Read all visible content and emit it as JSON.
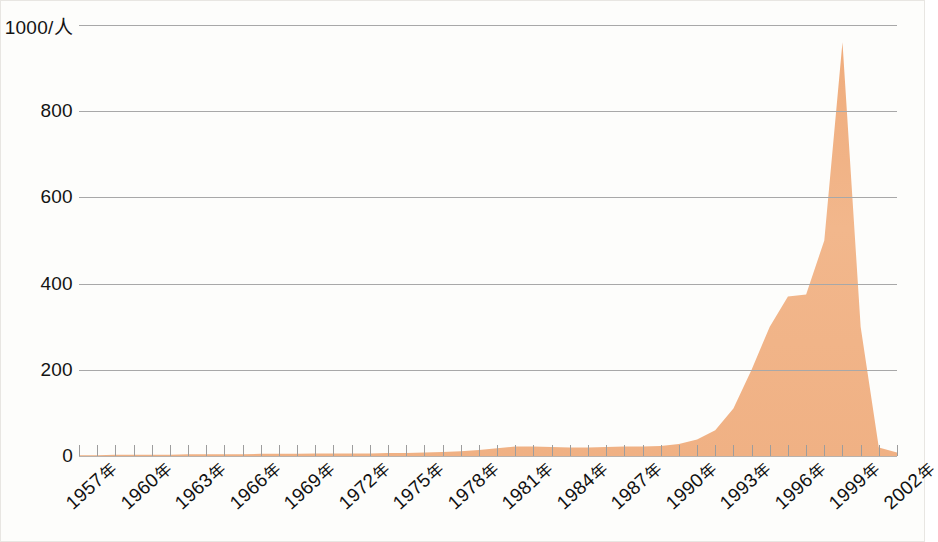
{
  "chart_data": {
    "type": "area",
    "title": "",
    "subtitle": "",
    "xlabel": "",
    "ylabel": "1000/人",
    "unit_label": "1000/人",
    "grid": true,
    "legend": "none",
    "xlim": [
      1957,
      2002
    ],
    "ylim": [
      0,
      1000
    ],
    "ytick_labels": [
      "0",
      "200",
      "400",
      "600",
      "800",
      "1000/人"
    ],
    "ytick_values": [
      0,
      200,
      400,
      600,
      800,
      1000
    ],
    "xtick_labels": [
      "1957年",
      "1960年",
      "1963年",
      "1966年",
      "1969年",
      "1972年",
      "1975年",
      "1978年",
      "1981年",
      "1984年",
      "1987年",
      "1990年",
      "1993年",
      "1996年",
      "1999年",
      "2002年"
    ],
    "xtick_values": [
      1957,
      1960,
      1963,
      1966,
      1969,
      1972,
      1975,
      1978,
      1981,
      1984,
      1987,
      1990,
      1993,
      1996,
      1999,
      2002
    ],
    "xtick_interval": 3,
    "series_color": "#f0b184",
    "series": [
      {
        "name": "人数",
        "x": [
          1957,
          1958,
          1959,
          1960,
          1961,
          1962,
          1963,
          1964,
          1965,
          1966,
          1967,
          1968,
          1969,
          1970,
          1971,
          1972,
          1973,
          1974,
          1975,
          1976,
          1977,
          1978,
          1979,
          1980,
          1981,
          1982,
          1983,
          1984,
          1985,
          1986,
          1987,
          1988,
          1989,
          1990,
          1991,
          1992,
          1993,
          1994,
          1995,
          1996,
          1997,
          1998,
          1999,
          2000,
          2001,
          2002
        ],
        "values": [
          2,
          2,
          3,
          3,
          3,
          3,
          4,
          4,
          4,
          4,
          5,
          5,
          5,
          6,
          6,
          6,
          6,
          7,
          7,
          8,
          9,
          11,
          14,
          18,
          22,
          22,
          21,
          20,
          20,
          21,
          22,
          22,
          23,
          28,
          38,
          60,
          110,
          200,
          300,
          370,
          375,
          500,
          960,
          300,
          20,
          8
        ]
      }
    ],
    "annotations": [
      {
        "label": "peak",
        "x": 1999,
        "y": 960
      },
      {
        "label": "plateau",
        "x": 1996,
        "y": 375
      }
    ]
  },
  "axes": {
    "y_axis_name": "y-axis",
    "x_axis_name": "x-axis"
  }
}
